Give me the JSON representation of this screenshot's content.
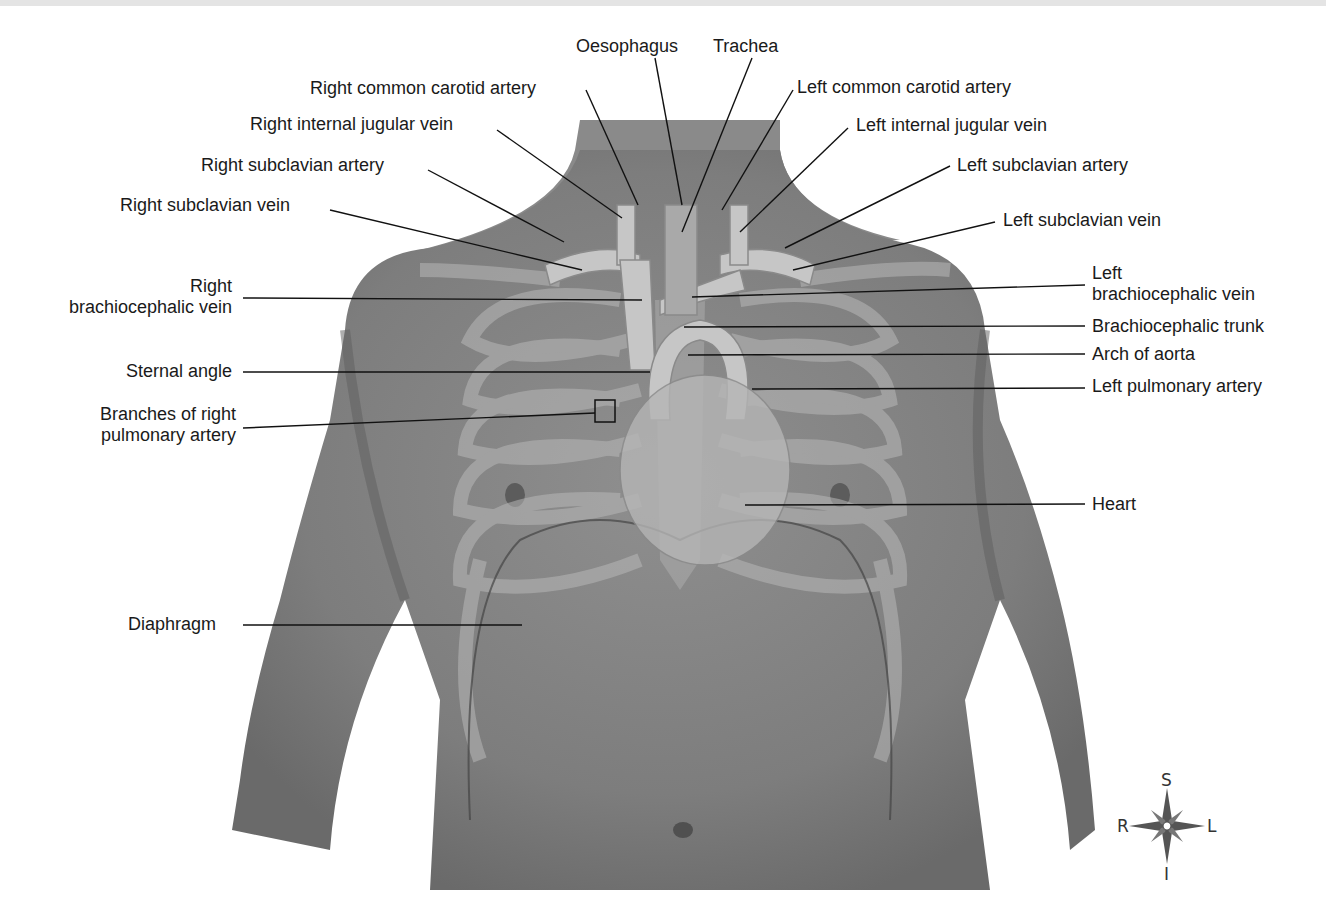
{
  "figure": {
    "labels": {
      "oesophagus": "Oesophagus",
      "trachea": "Trachea",
      "right_common_carotid_artery": "Right common carotid artery",
      "right_internal_jugular_vein": "Right internal jugular vein",
      "right_subclavian_artery": "Right subclavian artery",
      "right_subclavian_vein": "Right subclavian vein",
      "right_brachiocephalic_vein_line1": "Right",
      "right_brachiocephalic_vein_line2": "brachiocephalic vein",
      "sternal_angle": "Sternal angle",
      "branches_right_pulmonary_artery_line1": "Branches of right",
      "branches_right_pulmonary_artery_line2": "pulmonary artery",
      "diaphragm": "Diaphragm",
      "left_common_carotid_artery": "Left common carotid artery",
      "left_internal_jugular_vein": "Left internal jugular vein",
      "left_subclavian_artery": "Left subclavian artery",
      "left_subclavian_vein": "Left subclavian vein",
      "left_brachiocephalic_vein_line1": "Left",
      "left_brachiocephalic_vein_line2": "brachiocephalic vein",
      "brachiocephalic_trunk": "Brachiocephalic trunk",
      "arch_of_aorta": "Arch of aorta",
      "left_pulmonary_artery": "Left pulmonary artery",
      "heart": "Heart"
    },
    "compass": {
      "superior": "S",
      "inferior": "I",
      "right": "R",
      "left": "L"
    },
    "colors": {
      "skin": "#8a8a8a",
      "skin_dark": "#6f6f6f",
      "bone_overlay": "#b9b9b9",
      "vessel": "#c4c4c4",
      "leader_line": "#111111"
    }
  }
}
